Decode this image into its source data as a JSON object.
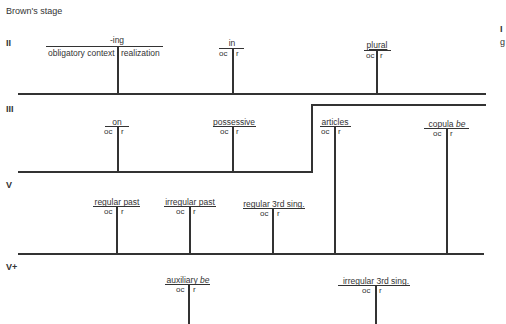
{
  "title": "Brown's stage",
  "stages": [
    "II",
    "III",
    "V",
    "V+"
  ],
  "ing": {
    "label": "-ing",
    "left": "obligatory context",
    "right": "realization"
  },
  "oc": "oc",
  "r": "r",
  "morphemes": {
    "in": "in",
    "plural": "plural",
    "on": "on",
    "possessive": "possessive",
    "articles": "articles",
    "copula": "copula",
    "copula_it": "be",
    "regular_past": "regular past",
    "irregular_past": "irregular past",
    "regular_3rd": "regular 3rd sing.",
    "auxiliary": "auxiliary",
    "auxiliary_it": "be",
    "irregular_3rd": "irregular 3rd sing."
  },
  "edge_text": [
    "I",
    "g"
  ]
}
